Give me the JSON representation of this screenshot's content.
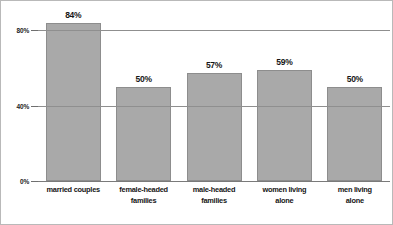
{
  "chart_data": {
    "type": "bar",
    "title": "",
    "subtitle": "",
    "xlabel": "",
    "ylabel": "",
    "categories": [
      "married couples",
      "female-headed families",
      "male-headed families",
      "women living alone",
      "men living alone"
    ],
    "category_lines": [
      [
        "married couples"
      ],
      [
        "female-headed",
        "families"
      ],
      [
        "male-headed",
        "families"
      ],
      [
        "women living",
        "alone"
      ],
      [
        "men living",
        "alone"
      ]
    ],
    "values": [
      84,
      50,
      57,
      59,
      50
    ],
    "value_labels": [
      "84%",
      "50%",
      "57%",
      "59%",
      "50%"
    ],
    "ylim": [
      0,
      88
    ],
    "yticks": [
      0,
      40,
      80
    ],
    "ytick_labels": [
      "0%",
      "40%",
      "80%"
    ],
    "grid": true,
    "grid_axis": "y",
    "legend": false,
    "legend_position": "none",
    "bar_color": "#a9a9a9",
    "bar_border_color": "#8d8d8d",
    "gridline_color": "#8f8f8f",
    "text_color": "#161616",
    "frame_color": "#b9b9b9",
    "background": "#ffffff"
  }
}
